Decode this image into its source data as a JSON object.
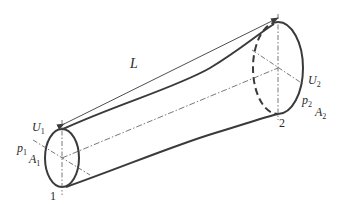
{
  "figure": {
    "type": "pipe-segment-diagram",
    "length_label": "L",
    "section_1": {
      "index_label": "1",
      "velocity": {
        "symbol": "U",
        "sub": "1"
      },
      "pressure": {
        "symbol": "p",
        "sub": "1"
      },
      "area": {
        "symbol": "A",
        "sub": "1"
      }
    },
    "section_2": {
      "index_label": "2",
      "velocity": {
        "symbol": "U",
        "sub": "2"
      },
      "pressure": {
        "symbol": "p",
        "sub": "2"
      },
      "area": {
        "symbol": "A",
        "sub": "2"
      }
    },
    "colors": {
      "stroke": "#3a3a3a",
      "text": "#2a2a2a",
      "background": "#ffffff"
    }
  }
}
